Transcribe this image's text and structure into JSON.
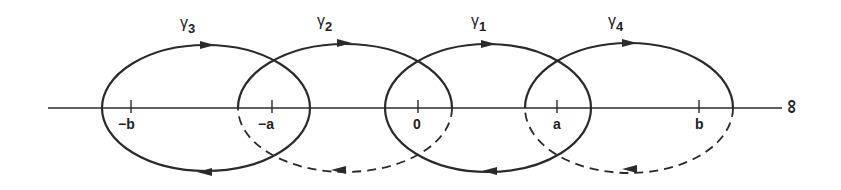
{
  "figure": {
    "axis": {
      "end_label": "∞",
      "y": 108,
      "x_start": 48,
      "x_end": 782
    },
    "ticks": [
      {
        "label": "−b",
        "x": 131
      },
      {
        "label": "−a",
        "x": 272
      },
      {
        "label": "0",
        "x": 418
      },
      {
        "label": "a",
        "x": 557
      },
      {
        "label": "b",
        "x": 699
      }
    ],
    "contours": [
      {
        "name": "γ",
        "index": "3",
        "cx": 206,
        "rx": 104,
        "lower_dashed": false
      },
      {
        "name": "γ",
        "index": "2",
        "cx": 345,
        "rx": 107,
        "lower_dashed": true
      },
      {
        "name": "γ",
        "index": "1",
        "cx": 488,
        "rx": 103,
        "lower_dashed": false
      },
      {
        "name": "γ",
        "index": "4",
        "cx": 628,
        "rx": 104,
        "lower_dashed": true
      }
    ],
    "stroke_color": "#2a2a2a"
  }
}
